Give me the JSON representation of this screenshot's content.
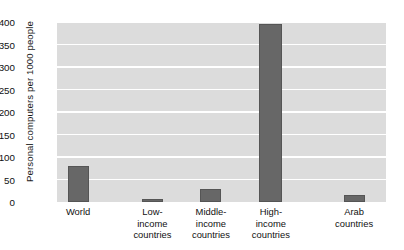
{
  "chart_data": {
    "type": "bar",
    "title": "",
    "xlabel": "",
    "ylabel": "Personal computers per 1000 people",
    "categories": [
      "World",
      "Low-\nincome\ncountries",
      "Middle-\nincome\ncountries",
      "High-\nincome\ncountries",
      "Arab\ncountries"
    ],
    "values": [
      80,
      6,
      30,
      395,
      16
    ],
    "ylim": [
      0,
      400
    ],
    "yticks": [
      0,
      50,
      100,
      150,
      200,
      250,
      300,
      350,
      400
    ],
    "ytick_labels": [
      "0",
      "50",
      "100",
      "150",
      "200",
      "250",
      "300",
      "350",
      "400"
    ],
    "grid": true,
    "grid_axis": "y",
    "legend": false,
    "bar_color": "#676767",
    "plot_background": "#dcdcdc",
    "grid_color": "#ffffff",
    "page_background": "#ffffff"
  },
  "bar_geometry": [
    {
      "center_pct": 6.4,
      "width_pct": 6.4
    },
    {
      "center_pct": 29.0,
      "width_pct": 6.4
    },
    {
      "center_pct": 46.8,
      "width_pct": 6.4
    },
    {
      "center_pct": 65.0,
      "width_pct": 7.0
    },
    {
      "center_pct": 90.3,
      "width_pct": 6.4
    }
  ]
}
